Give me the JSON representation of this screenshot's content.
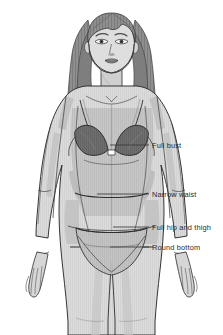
{
  "diagram": {
    "attire": "bra and panty",
    "background_color": "#ffffff",
    "line_color": "#2b2b2b",
    "skin_fill": "#d9d9d9",
    "skin_shadow": "#bdbdbd",
    "hair_fill": "#8e8e8e",
    "hair_dark": "#6a6a6a",
    "bra_fill": "#6b6b6b",
    "panty_fill": "#b0b0b0",
    "torso_shade": "#c7c7c7",
    "leader_line_color": "#3a3a3a",
    "label_color": "#2b2b2b"
  },
  "callouts": [
    {
      "id": "full-bust",
      "label": "Full bust",
      "label_x": 152,
      "label_y": 141,
      "line_from_x": 110,
      "line_from_y": 145,
      "line_to_x": 149,
      "line_to_y": 145
    },
    {
      "id": "narrow-waist",
      "label": "Narrow waist",
      "label_x": 152,
      "label_y": 190,
      "line_from_x": 97,
      "line_from_y": 194,
      "line_to_x": 149,
      "line_to_y": 194
    },
    {
      "id": "full-hip-and-thigh",
      "label": "Full hip and thigh",
      "label_x": 152,
      "label_y": 223,
      "line_from_x": 113,
      "line_from_y": 227,
      "line_to_x": 149,
      "line_to_y": 227
    },
    {
      "id": "round-bottom",
      "label": "Round bottom",
      "label_x": 152,
      "label_y": 243,
      "line_from_x": 110,
      "line_from_y": 247,
      "line_to_x": 149,
      "line_to_y": 247
    }
  ]
}
